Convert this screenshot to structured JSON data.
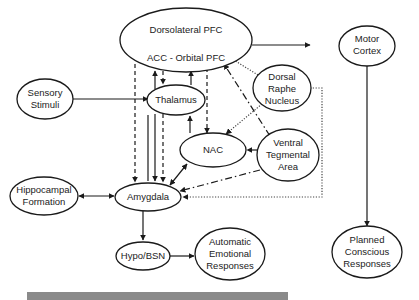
{
  "diagram": {
    "nodes": {
      "pfc": {
        "line1": "Dorsolateral PFC",
        "line2": "ACC - Orbital PFC"
      },
      "motor": {
        "line1": "Motor",
        "line2": "Cortex"
      },
      "sensory": {
        "line1": "Sensory",
        "line2": "Stimuli"
      },
      "thalamus": {
        "label": "Thalamus"
      },
      "raphe": {
        "line1": "Dorsal",
        "line2": "Raphe",
        "line3": "Nucleus"
      },
      "vta": {
        "line1": "Ventral",
        "line2": "Tegmental",
        "line3": "Area"
      },
      "nac": {
        "label": "NAC"
      },
      "amygdala": {
        "label": "Amygdala"
      },
      "hippocampal": {
        "line1": "Hippocampal",
        "line2": "Formation"
      },
      "hypo": {
        "label": "Hypo/BSN"
      },
      "automatic": {
        "line1": "Automatic",
        "line2": "Emotional",
        "line3": "Responses"
      },
      "planned": {
        "line1": "Planned",
        "line2": "Conscious",
        "line3": "Responses"
      }
    },
    "edges": [
      {
        "from": "Dorsolateral PFC",
        "to": "ACC - Orbital PFC",
        "style": "solid",
        "direction": "both"
      },
      {
        "from": "PFC",
        "to": "Motor Cortex",
        "style": "solid"
      },
      {
        "from": "Sensory Stimuli",
        "to": "Thalamus",
        "style": "solid"
      },
      {
        "from": "Thalamus",
        "to": "PFC",
        "style": "solid"
      },
      {
        "from": "PFC",
        "to": "Thalamus",
        "style": "dashed"
      },
      {
        "from": "PFC",
        "to": "Amygdala",
        "style": "dashed"
      },
      {
        "from": "PFC",
        "to": "NAC",
        "style": "dashed"
      },
      {
        "from": "Amygdala",
        "to": "PFC",
        "style": "solid"
      },
      {
        "from": "Thalamus",
        "to": "Amygdala",
        "style": "solid"
      },
      {
        "from": "Thalamus",
        "to": "Amygdala",
        "style": "dashed"
      },
      {
        "from": "NAC",
        "to": "Thalamus",
        "style": "solid"
      },
      {
        "from": "Amygdala",
        "to": "NAC",
        "style": "solid",
        "direction": "both"
      },
      {
        "from": "Dorsal Raphe Nucleus",
        "to": "PFC",
        "style": "dotted"
      },
      {
        "from": "Dorsal Raphe Nucleus",
        "to": "NAC",
        "style": "dotted"
      },
      {
        "from": "Dorsal Raphe Nucleus",
        "to": "Amygdala",
        "style": "dotted"
      },
      {
        "from": "Ventral Tegmental Area",
        "to": "PFC",
        "style": "dash-dot"
      },
      {
        "from": "Ventral Tegmental Area",
        "to": "NAC",
        "style": "dash-dot"
      },
      {
        "from": "Ventral Tegmental Area",
        "to": "Amygdala",
        "style": "dash-dot"
      },
      {
        "from": "Hippocampal Formation",
        "to": "Amygdala",
        "style": "solid",
        "direction": "both"
      },
      {
        "from": "Amygdala",
        "to": "Hypo/BSN",
        "style": "solid"
      },
      {
        "from": "Hypo/BSN",
        "to": "Automatic Emotional Responses",
        "style": "solid"
      },
      {
        "from": "Motor Cortex",
        "to": "Planned Conscious Responses",
        "style": "solid"
      }
    ]
  },
  "colors": {
    "stroke": "#1a1a1a",
    "text": "#222222",
    "bar": "#8a8a8a"
  }
}
